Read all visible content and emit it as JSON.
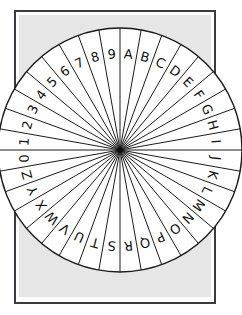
{
  "canvas": {
    "width": 242,
    "height": 315,
    "background": "#ffffff"
  },
  "paper": {
    "frame": {
      "x": 14,
      "y": 10,
      "width": 202,
      "height": 294,
      "border_color": "#3a3c40",
      "border_width": 2,
      "fill": "#ffffff"
    },
    "panel": {
      "x": 19,
      "y": 15,
      "width": 192,
      "height": 282,
      "fill": "#e6e6e6"
    }
  },
  "wheel": {
    "center_x": 120,
    "center_y": 150,
    "radius": 122,
    "hub_radius": 2.6,
    "sector_count": 36,
    "start_angle_deg": -90,
    "rim_color": "#1b1b1b",
    "sector_line_color": "#1b1b1b",
    "face_color": "#ffffff",
    "label_color": "#101010",
    "label_radius_ratio": 0.78,
    "labels": [
      "A",
      "B",
      "C",
      "D",
      "E",
      "F",
      "G",
      "H",
      "I",
      "J",
      "K",
      "L",
      "M",
      "N",
      "O",
      "P",
      "Q",
      "R",
      "S",
      "T",
      "U",
      "V",
      "W",
      "X",
      "Y",
      "Z",
      "0",
      "1",
      "2",
      "3",
      "4",
      "5",
      "6",
      "7",
      "8",
      "9"
    ]
  }
}
